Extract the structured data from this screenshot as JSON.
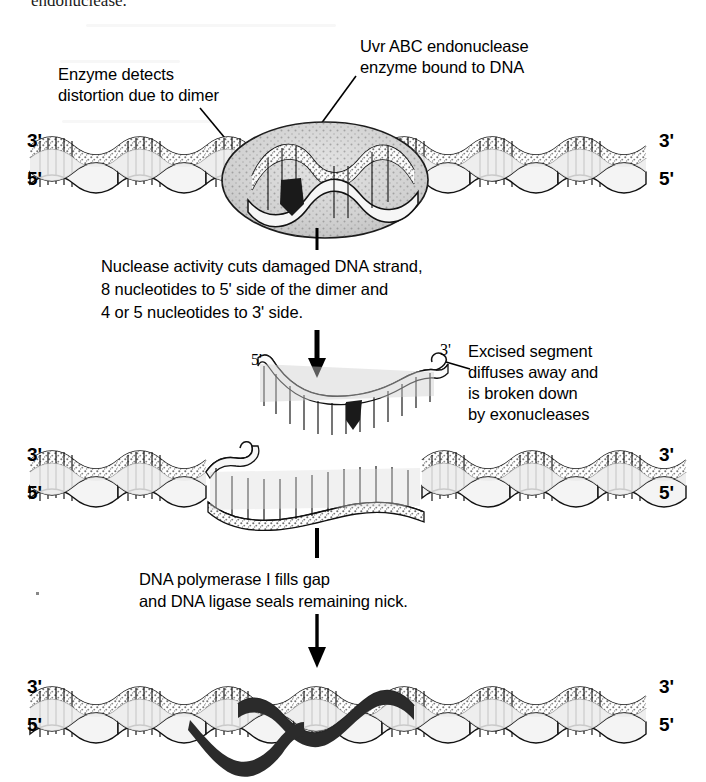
{
  "document": {
    "type": "textbook-figure",
    "topic": "Nucleotide excision repair of a pyrimidine dimer in DNA",
    "cropped_caption_tail": "endonuclease.",
    "background_color": "#ffffff",
    "ink_color": "#000000"
  },
  "annotations": {
    "enzyme_detects": {
      "line1": "Enzyme detects",
      "line2": "distortion due to dimer"
    },
    "uvr_abc": {
      "line1": "Uvr ABC endonuclease",
      "line2": "enzyme bound to DNA"
    },
    "nuclease_activity": {
      "line1": "Nuclease activity cuts damaged DNA strand,",
      "line2": "8 nucleotides to 5' side of the dimer and",
      "line3": "4 or 5 nucleotides to 3' side."
    },
    "excised_segment": {
      "line1": "Excised segment",
      "line2": "diffuses away and",
      "line3": "is broken down",
      "line4": "by exonucleases"
    },
    "polymerase": {
      "line1": "DNA polymerase I fills gap",
      "line2": "and DNA ligase seals remaining nick."
    }
  },
  "labels": {
    "three_prime": "3'",
    "five_prime": "5'"
  },
  "panels": [
    {
      "id": "panel-1-enzyme-bound",
      "name": "DNA duplex with Uvr ABC endonuclease bound over the thymine dimer",
      "end_labels": {
        "left_top": "3'",
        "left_bottom": "5'",
        "right_top": "3'",
        "right_bottom": "5'"
      }
    },
    {
      "id": "panel-2-excised-fragment",
      "name": "Excised oligonucleotide fragment containing the dimer",
      "end_labels": {
        "left": "5'",
        "right": "3'"
      }
    },
    {
      "id": "panel-3-gapped-duplex",
      "name": "DNA duplex with a single-strand gap after excision",
      "end_labels": {
        "left_top": "3'",
        "left_bottom": "5'",
        "right_top": "3'",
        "right_bottom": "5'"
      }
    },
    {
      "id": "panel-4-repaired-duplex",
      "name": "Repaired DNA duplex with newly synthesized dark strand segment",
      "end_labels": {
        "left_top": "3'",
        "left_bottom": "5'",
        "right_top": "3'",
        "right_bottom": "5'"
      }
    }
  ],
  "colors": {
    "enzyme_fill": "#d6d6d6",
    "backbone_fill": "#f2f2f2",
    "stipple": "#9a9a9a",
    "dimer_mark": "#1a1a1a",
    "new_strand": "#262626"
  }
}
